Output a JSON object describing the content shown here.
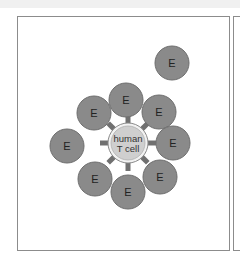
{
  "figure": {
    "panel_count_visible": 2,
    "center_cell": {
      "label_line1": "human",
      "label_line2": "T cell",
      "cx": 128,
      "cy": 143,
      "r": 18,
      "fill": "#cfcfcf",
      "ring": "#f2f2f2",
      "stroke": "#8a8a8a"
    },
    "receptor_color": "#707070",
    "effector_cells": [
      {
        "label": "E",
        "cx": 172,
        "cy": 63
      },
      {
        "label": "E",
        "cx": 126,
        "cy": 100
      },
      {
        "label": "E",
        "cx": 94,
        "cy": 113
      },
      {
        "label": "E",
        "cx": 159,
        "cy": 112
      },
      {
        "label": "E",
        "cx": 67,
        "cy": 146
      },
      {
        "label": "E",
        "cx": 173,
        "cy": 143
      },
      {
        "label": "E",
        "cx": 95,
        "cy": 179
      },
      {
        "label": "E",
        "cx": 160,
        "cy": 177
      },
      {
        "label": "E",
        "cx": 128,
        "cy": 192
      }
    ],
    "effector_style": {
      "r": 17,
      "fill": "#8a8a8a",
      "stroke": "#6e6e6e"
    }
  }
}
